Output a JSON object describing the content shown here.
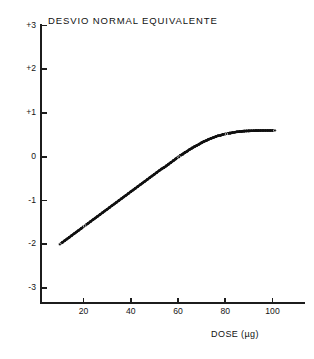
{
  "chart_data": {
    "type": "scatter",
    "title": "DESVIO NORMAL EQUIVALENTE",
    "xlabel": "DOSE (µg)",
    "ylabel": "",
    "xlim": [
      0,
      115
    ],
    "ylim": [
      -3.4,
      3.0
    ],
    "grid": false,
    "legend": null,
    "x_ticks": [
      20,
      40,
      60,
      80,
      100
    ],
    "x_tick_labels": [
      "20",
      "40",
      "60",
      "80",
      "100"
    ],
    "y_ticks": [
      3,
      2,
      1,
      0,
      -1,
      -2,
      -3
    ],
    "y_tick_labels": [
      "+3",
      "+2",
      "+1",
      "0",
      "-1",
      "-2",
      "-3"
    ],
    "marker_color": "#101010",
    "series": [
      {
        "name": "dose-response",
        "x": [
          10.0,
          11.0,
          12.0,
          13.0,
          14.0,
          15.0,
          16.0,
          17.0,
          18.0,
          19.0,
          20.0,
          21.0,
          22.0,
          23.0,
          24.0,
          25.0,
          26.0,
          27.0,
          28.0,
          29.0,
          30.0,
          31.0,
          32.0,
          33.0,
          34.0,
          35.0,
          36.0,
          37.0,
          38.0,
          39.0,
          40.0,
          41.0,
          42.0,
          43.0,
          44.0,
          45.0,
          46.0,
          47.0,
          48.0,
          49.0,
          50.0,
          51.0,
          52.0,
          53.0,
          54.0,
          55.0,
          56.0,
          57.0,
          58.0,
          59.0,
          60.0,
          61.0,
          62.0,
          63.0,
          64.0,
          65.0,
          66.0,
          67.0,
          68.0,
          69.0,
          70.0,
          71.0,
          72.0,
          73.0,
          74.0,
          75.0,
          76.0,
          77.0,
          78.0,
          79.0,
          80.0,
          81.0,
          82.0,
          83.0,
          84.0,
          85.0,
          86.0,
          87.0,
          88.0,
          89.0,
          90.0,
          91.0,
          92.0,
          93.0,
          94.0,
          95.0,
          96.0,
          97.0,
          98.0,
          99.0,
          100.0,
          101.0
        ],
        "y": [
          -2.0,
          -1.96,
          -1.92,
          -1.88,
          -1.84,
          -1.8,
          -1.76,
          -1.72,
          -1.68,
          -1.64,
          -1.6,
          -1.56,
          -1.52,
          -1.48,
          -1.44,
          -1.4,
          -1.36,
          -1.32,
          -1.28,
          -1.24,
          -1.2,
          -1.16,
          -1.12,
          -1.08,
          -1.04,
          -1.0,
          -0.96,
          -0.92,
          -0.88,
          -0.84,
          -0.8,
          -0.76,
          -0.72,
          -0.68,
          -0.64,
          -0.6,
          -0.56,
          -0.52,
          -0.48,
          -0.44,
          -0.4,
          -0.36,
          -0.32,
          -0.28,
          -0.25,
          -0.21,
          -0.17,
          -0.13,
          -0.09,
          -0.05,
          -0.01,
          0.03,
          0.06,
          0.1,
          0.13,
          0.17,
          0.2,
          0.23,
          0.26,
          0.29,
          0.32,
          0.35,
          0.37,
          0.4,
          0.42,
          0.44,
          0.46,
          0.48,
          0.49,
          0.51,
          0.52,
          0.53,
          0.54,
          0.55,
          0.56,
          0.57,
          0.575,
          0.58,
          0.585,
          0.59,
          0.592,
          0.594,
          0.596,
          0.597,
          0.598,
          0.599,
          0.6,
          0.6,
          0.6,
          0.6,
          0.6,
          0.6
        ]
      }
    ],
    "highlight_points": [
      {
        "x": 10.0,
        "y": -2.0
      },
      {
        "x": 20.5,
        "y": -1.58
      },
      {
        "x": 60.5,
        "y": -0.01
      },
      {
        "x": 80.5,
        "y": 0.52
      },
      {
        "x": 101.0,
        "y": 0.6
      }
    ]
  }
}
